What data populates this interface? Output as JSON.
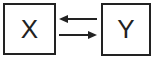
{
  "diagram": {
    "nodes": [
      {
        "id": "X",
        "label": "X"
      },
      {
        "id": "Y",
        "label": "Y"
      }
    ],
    "edges": [
      {
        "from": "Y",
        "to": "X",
        "direction": "left"
      },
      {
        "from": "X",
        "to": "Y",
        "direction": "right"
      }
    ],
    "colors": {
      "stroke": "#222222",
      "background": "#ffffff"
    }
  }
}
